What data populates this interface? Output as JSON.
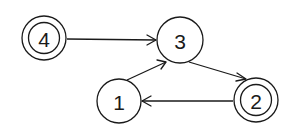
{
  "diagram": {
    "type": "state-transition-graph",
    "nodes": [
      {
        "id": "4",
        "label": "4",
        "cx": 44,
        "cy": 38,
        "r": 22,
        "double": true
      },
      {
        "id": "3",
        "label": "3",
        "cx": 180,
        "cy": 40,
        "r": 23,
        "double": false
      },
      {
        "id": "1",
        "label": "1",
        "cx": 119,
        "cy": 101,
        "r": 22,
        "double": false
      },
      {
        "id": "2",
        "label": "2",
        "cx": 256,
        "cy": 100,
        "r": 22,
        "double": true
      }
    ],
    "edges": [
      {
        "from": "4",
        "to": "3"
      },
      {
        "from": "1",
        "to": "3"
      },
      {
        "from": "3",
        "to": "2"
      },
      {
        "from": "2",
        "to": "1"
      }
    ],
    "colors": {
      "stroke": "#1a1a1a",
      "background": "#ffffff"
    }
  }
}
